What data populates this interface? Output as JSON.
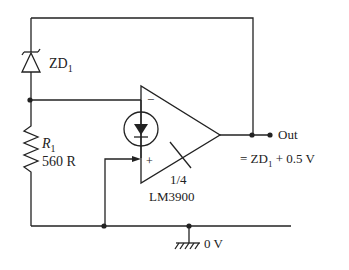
{
  "diagram": {
    "title": "",
    "components": {
      "zener": {
        "label": "ZD",
        "subscript": "1"
      },
      "resistor": {
        "label": "R",
        "subscript": "1",
        "value": "560 R"
      },
      "opamp": {
        "fraction": "1/4",
        "part": "LM3900",
        "minus": "−",
        "plus": "+"
      },
      "output": {
        "label": "Out",
        "equation_prefix": "= ZD",
        "equation_sub": "1",
        "equation_suffix": " + 0.5 V"
      },
      "ground": {
        "label": "0 V"
      }
    },
    "colors": {
      "ink": "#222222",
      "background": "#ffffff"
    }
  }
}
